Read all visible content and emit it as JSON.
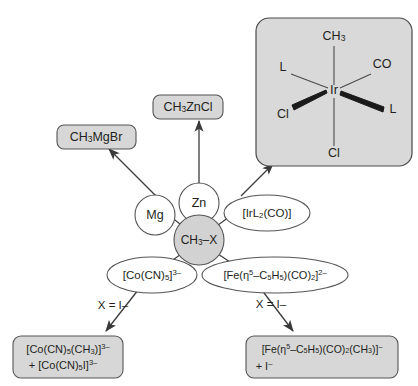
{
  "diagram": {
    "center_node": {
      "label_main": "CH",
      "label_sub": "3",
      "label_tail": "–X"
    },
    "reagent_nodes": [
      {
        "id": "mg",
        "label": "Mg",
        "shape": "circle"
      },
      {
        "id": "zn",
        "label": "Zn",
        "shape": "circle"
      },
      {
        "id": "ir",
        "label_parts": [
          "[IrL",
          "2",
          "(CO)]"
        ],
        "shape": "ellipse"
      },
      {
        "id": "co",
        "label_parts": [
          "[Co(CN)",
          "5",
          "]",
          "3–"
        ],
        "shape": "ellipse"
      },
      {
        "id": "fe",
        "label_parts": [
          "[Fe(η",
          "5",
          "–C",
          "5",
          "H",
          "5",
          ")(CO)",
          "2",
          "]",
          "2–"
        ],
        "shape": "ellipse"
      }
    ],
    "product_boxes": [
      {
        "id": "ch3mgbr",
        "lines": [
          {
            "parts": [
              "CH",
              "3",
              "MgBr"
            ]
          }
        ]
      },
      {
        "id": "ch3zncl",
        "lines": [
          {
            "parts": [
              "CH",
              "3",
              "ZnCl"
            ]
          }
        ]
      },
      {
        "id": "co_product",
        "lines": [
          {
            "parts": [
              "[Co(CN)",
              "5",
              "(CH",
              "3",
              ")]",
              "3–"
            ]
          },
          {
            "parts": [
              "+ [Co(CN)",
              "5",
              "I]",
              "3–"
            ]
          }
        ]
      },
      {
        "id": "fe_product",
        "lines": [
          {
            "parts": [
              "[Fe(η",
              "5",
              "–C",
              "5",
              "H",
              "5",
              ")(CO)",
              "2",
              "(CH",
              "3",
              ")]",
              "–"
            ]
          },
          {
            "parts": [
              "+ I",
              "–"
            ]
          }
        ]
      }
    ],
    "edge_labels": [
      {
        "id": "x-equals-i-left",
        "text": "X = I–"
      },
      {
        "id": "x-equals-i-right",
        "text": "X = I–"
      }
    ],
    "ir_complex": {
      "center_atom": "Ir",
      "ligands": [
        {
          "id": "ch3-axial",
          "label_parts": [
            "CH",
            "3"
          ],
          "position": "top",
          "bond": "plain"
        },
        {
          "id": "l-upper-left",
          "label": "L",
          "position": "upper-left",
          "bond": "plain"
        },
        {
          "id": "co-upper-right",
          "label": "CO",
          "position": "upper-right",
          "bond": "plain"
        },
        {
          "id": "cl-lower-left",
          "label": "Cl",
          "position": "lower-left",
          "bond": "wedge"
        },
        {
          "id": "l-lower-right",
          "label": "L",
          "position": "lower-right",
          "bond": "wedge"
        },
        {
          "id": "cl-bottom",
          "label": "Cl",
          "position": "bottom",
          "bond": "plain"
        }
      ]
    },
    "colors": {
      "box_fill": "#d7d7d7",
      "panel_fill": "#d9d9d9",
      "center_fill": "#d2d2d2",
      "ellipse_fill": "#ffffff",
      "stroke": "#555555",
      "text": "#231f20",
      "background": "#ffffff"
    }
  }
}
